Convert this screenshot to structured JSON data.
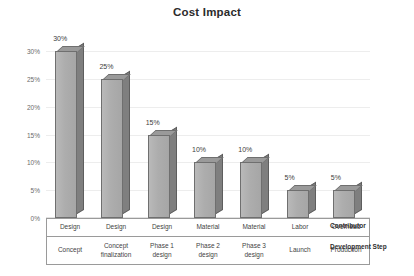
{
  "chart_data": {
    "type": "bar",
    "title": "Cost Impact",
    "subtitle": "",
    "xlabel": "",
    "ylabel": "",
    "categories": [
      "Concept",
      "Concept finalization",
      "Phase 1 design",
      "Phase 2 design",
      "Phase 3 design",
      "Launch",
      "Production"
    ],
    "values": [
      30,
      25,
      15,
      10,
      10,
      5,
      5
    ],
    "data_labels": [
      "30%",
      "25%",
      "15%",
      "10%",
      "10%",
      "5%",
      "5%"
    ],
    "ylim": [
      0,
      32
    ],
    "yticks": [
      0,
      5,
      10,
      15,
      20,
      25,
      30
    ],
    "ytick_labels": [
      "0%",
      "5%",
      "10%",
      "15%",
      "20%",
      "25%",
      "30%"
    ],
    "grid": true,
    "legend": false,
    "series": [
      {
        "name": "Cost Impact",
        "values": [
          30,
          25,
          15,
          10,
          10,
          5,
          5
        ]
      }
    ],
    "style": "3d-column",
    "bar_front_color": "#b0b0b0",
    "bar_side_color": "#7f7f7f",
    "bar_top_color": "#9a9a9a",
    "bar_edge_color": "#6f6f6f"
  },
  "table": {
    "row_keys": [
      "Contributor",
      "Development Step"
    ],
    "rows": [
      {
        "key": "Contributor",
        "cells": [
          "Design",
          "Design",
          "Design",
          "Material",
          "Material",
          "Labor",
          "Overhead"
        ]
      },
      {
        "key": "Development Step",
        "cells": [
          "Concept",
          "Concept finalization",
          "Phase 1 design",
          "Phase 2 design",
          "Phase 3 design",
          "Launch",
          "Production"
        ]
      }
    ]
  },
  "colors": {
    "background": "#ffffff",
    "title": "#2b2b2b",
    "text": "#3f3f3f",
    "gridline": "#ededed",
    "table_border": "#9a9a9a"
  }
}
